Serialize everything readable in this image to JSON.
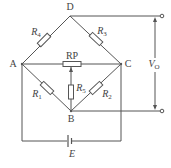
{
  "diagram": {
    "type": "wheatstone-bridge",
    "nodes": {
      "A": {
        "label": "A"
      },
      "B": {
        "label": "B"
      },
      "C": {
        "label": "C"
      },
      "D": {
        "label": "D"
      }
    },
    "components": {
      "R1": {
        "name": "R",
        "sub": "1",
        "between": "A-B"
      },
      "R2": {
        "name": "R",
        "sub": "2",
        "between": "B-C"
      },
      "R3": {
        "name": "R",
        "sub": "3",
        "between": "D-C"
      },
      "R4": {
        "name": "R",
        "sub": "4",
        "between": "A-D"
      },
      "R5": {
        "name": "R",
        "sub": "5",
        "between": "RP wiper-B"
      },
      "RP": {
        "name": "RP",
        "between": "A-C (potentiometer)"
      },
      "E": {
        "name": "E",
        "type": "battery",
        "between": "A-C"
      }
    },
    "output": {
      "name": "V",
      "sub": "O",
      "terminals": [
        "D",
        "B"
      ]
    },
    "colors": {
      "line": "#555555",
      "text": "#444444",
      "background": "#ffffff"
    }
  }
}
